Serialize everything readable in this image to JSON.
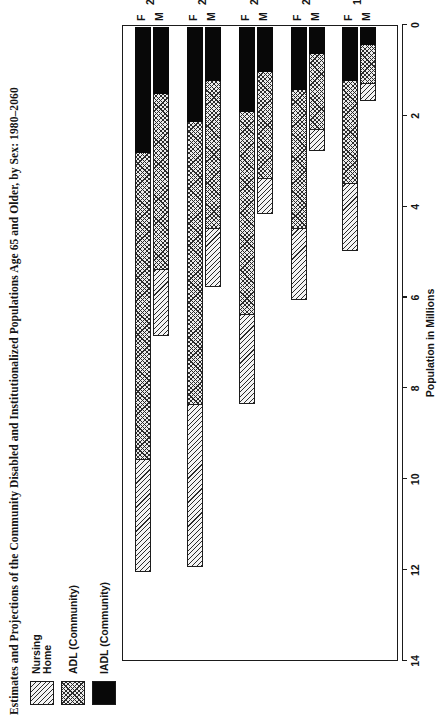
{
  "figure": {
    "title": "Estimates and Projections of the Community Disabled and Institutionalized Populations Age 65 and Older, by Sex: 1980–2060",
    "source_label": "Sources:",
    "source_text": " Manton, K. G., and Soldo, B. 1985. “Dynamics of Health Changes in the Oldest Old: New Perspectives and Evidence.” Milbank Memorial Fund Quarterly 63:206–285 (Table 11); Manton, K. G., 1989. “Epidemiological, Demographic, and Social Correlates of Disability among the Elderly.” Milbank Memorial Fund Quarterly 67:13–58"
  },
  "legend": {
    "items": [
      {
        "label": "Nursing\nHome",
        "pattern": "diagonal-hatch",
        "key": "nursing_home"
      },
      {
        "label": "ADL  (Community)",
        "pattern": "cross-hatch",
        "key": "adl"
      },
      {
        "label": "IADL  (Community)",
        "pattern": "solid-black",
        "key": "iadl"
      }
    ]
  },
  "chart_data": {
    "type": "bar",
    "orientation": "horizontal-rotated",
    "title": "Estimates and Projections of the Community Disabled and Institutionalized Populations Age 65 and Older, by Sex: 1980–2060",
    "xlabel": "Population in Millions",
    "ylabel": "",
    "xlim": [
      0,
      14
    ],
    "xticks": [
      0,
      2,
      4,
      6,
      8,
      10,
      12,
      14
    ],
    "xtick_labels": [
      "0",
      "2",
      "4",
      "6",
      "8",
      "10",
      "12",
      "14"
    ],
    "grid": false,
    "legend_position": "top-left",
    "stacked": true,
    "years": [
      "1980",
      "2000",
      "2020",
      "2040",
      "2060"
    ],
    "sexes": [
      "M",
      "F"
    ],
    "categories": [
      "1980 M",
      "1980 F",
      "2000 M",
      "2000 F",
      "2020 M",
      "2020 F",
      "2040 M",
      "2040 F",
      "2060 M",
      "2060 F"
    ],
    "series": [
      {
        "name": "IADL (Community)",
        "key": "iadl",
        "color": "#080808",
        "values": [
          0.4,
          1.2,
          0.6,
          1.4,
          1.0,
          1.9,
          1.2,
          2.1,
          1.5,
          2.8
        ]
      },
      {
        "name": "ADL (Community)",
        "key": "adl",
        "color": "#ececec",
        "values": [
          0.9,
          2.3,
          1.7,
          3.1,
          2.4,
          4.5,
          3.3,
          6.3,
          3.9,
          6.8
        ]
      },
      {
        "name": "Nursing Home",
        "key": "nursing_home",
        "color": "#f4f4f4",
        "values": [
          0.4,
          1.5,
          0.5,
          1.6,
          0.8,
          2.0,
          1.3,
          3.6,
          1.5,
          2.5
        ]
      }
    ],
    "totals": [
      1.7,
      5.0,
      2.8,
      6.1,
      4.2,
      8.4,
      5.8,
      12.0,
      6.9,
      12.1
    ]
  },
  "axis": {
    "tick_labels": [
      "0",
      "2",
      "4",
      "6",
      "8",
      "10",
      "12",
      "14"
    ],
    "title": "Population in Millions"
  },
  "category_labels": [
    {
      "year": "1980",
      "m": "M",
      "f": "F"
    },
    {
      "year": "2000",
      "m": "M",
      "f": "F"
    },
    {
      "year": "2020",
      "m": "M",
      "f": "F"
    },
    {
      "year": "2040",
      "m": "M",
      "f": "F"
    },
    {
      "year": "2060",
      "m": "M",
      "f": "F"
    }
  ]
}
